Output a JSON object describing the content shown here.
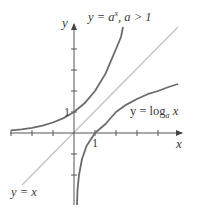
{
  "figure": {
    "axes": {
      "x_label": "x",
      "y_label": "y",
      "x_tick_label": "1",
      "y_tick_label": "1",
      "x_ticks": [
        -3,
        -2,
        -1,
        1,
        2,
        3,
        4
      ],
      "y_ticks": [
        -2,
        -1,
        1,
        2,
        3,
        4
      ]
    },
    "curves": [
      {
        "name": "exponential",
        "label_lhs": "y = ",
        "label_base": "a",
        "label_exp": "x",
        "label_cond": ", a > 1",
        "color": "#6b6b6b"
      },
      {
        "name": "logarithm",
        "label_lhs": "y = log",
        "label_sub": "a",
        "label_arg": " x",
        "color": "#6b6b6b"
      },
      {
        "name": "identity",
        "label": "y = x",
        "color": "#c4c4c4"
      }
    ],
    "colors": {
      "axis": "#555555",
      "curve": "#6b6b6b",
      "identity_line": "#c8c8c8",
      "text": "#3a3a3a",
      "background": "#ffffff"
    }
  }
}
